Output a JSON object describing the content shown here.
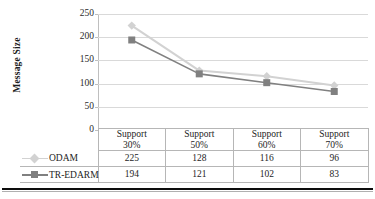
{
  "chart_data": {
    "type": "line",
    "title": "",
    "xlabel": "",
    "ylabel": "Message Size",
    "categories": [
      "Support 30%",
      "Support 50%",
      "Support 60%",
      "Support 70%"
    ],
    "category_lines": [
      [
        "Support",
        "30%"
      ],
      [
        "Support",
        "50%"
      ],
      [
        "Support",
        "60%"
      ],
      [
        "Support",
        "70%"
      ]
    ],
    "series": [
      {
        "name": "ODAM",
        "values": [
          225,
          128,
          116,
          96
        ],
        "color": "#d2d2d2",
        "marker": "diamond"
      },
      {
        "name": "TR-EDARM",
        "values": [
          194,
          121,
          102,
          83
        ],
        "color": "#808080",
        "marker": "square"
      }
    ],
    "ylim": [
      0,
      250
    ],
    "yticks": [
      "0",
      "50",
      "100",
      "150",
      "200",
      "250"
    ],
    "ytick_values": [
      0,
      50,
      100,
      150,
      200,
      250
    ],
    "grid": true,
    "legend_position": "data-table-left-column",
    "data_table_shown": true
  },
  "axis": {
    "y_title": "Message Size",
    "t250": "250",
    "t200": "200",
    "t150": "150",
    "t100": "100",
    "t50": "50",
    "t0": "0"
  },
  "table": {
    "header": [
      {
        "l1": "Support",
        "l2": "30%"
      },
      {
        "l1": "Support",
        "l2": "50%"
      },
      {
        "l1": "Support",
        "l2": "60%"
      },
      {
        "l1": "Support",
        "l2": "70%"
      }
    ],
    "rows": [
      {
        "name": "ODAM",
        "cells": [
          "225",
          "128",
          "116",
          "96"
        ]
      },
      {
        "name": "TR-EDARM",
        "cells": [
          "194",
          "121",
          "102",
          "83"
        ]
      }
    ]
  },
  "colors": {
    "odam": "#d2d2d2",
    "tredarm": "#808080",
    "grid": "#d9d9d9",
    "border": "#b6b6b6",
    "text": "#1d1d1d"
  }
}
